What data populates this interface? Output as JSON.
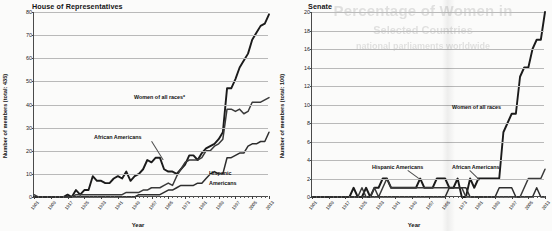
{
  "page": {
    "bleed_text_line1": "Percentage of Women in",
    "bleed_text_line2": "Selected Countries",
    "bleed_text_line3": "national parliaments worldwide"
  },
  "charts": [
    {
      "id": "house",
      "title": "House of Representatives",
      "xlabel": "Year",
      "ylabel": "Number of members (total: 435)",
      "yticks": [
        0,
        10,
        20,
        30,
        40,
        50,
        60,
        70,
        80
      ],
      "ylim": [
        0,
        80
      ],
      "xticks": [
        1901,
        1909,
        1917,
        1925,
        1933,
        1941,
        1949,
        1957,
        1965,
        1973,
        1981,
        1989,
        1997,
        2005,
        2013
      ],
      "xlim": [
        1901,
        2013
      ],
      "annotations": [
        {
          "name": "women-of-all-races",
          "text": "Women of all races*"
        },
        {
          "name": "african-americans",
          "text": "African Americans"
        },
        {
          "name": "hispanic-americans-line1",
          "text": "Hispanic"
        },
        {
          "name": "hispanic-americans-line2",
          "text": "Americans"
        }
      ]
    },
    {
      "id": "senate",
      "title": "Senate",
      "xlabel": "Year",
      "ylabel": "Number of members (total: 100)",
      "yticks": [
        0,
        2,
        4,
        6,
        8,
        10,
        12,
        14,
        16,
        18,
        20
      ],
      "ylim": [
        0,
        20
      ],
      "xticks": [
        1901,
        1909,
        1917,
        1925,
        1933,
        1941,
        1949,
        1957,
        1965,
        1973,
        1981,
        1989,
        1997,
        2005,
        2013
      ],
      "xlim": [
        1901,
        2013
      ],
      "annotations": [
        {
          "name": "women-of-all-races",
          "text": "Women of all races"
        },
        {
          "name": "hispanic-americans",
          "text": "Hispanic Americans"
        },
        {
          "name": "african-americans",
          "text": "African Americans"
        }
      ]
    }
  ],
  "chart_data": [
    {
      "type": "line",
      "id": "house",
      "title": "House of Representatives",
      "xlabel": "Year",
      "ylabel": "Number of members (total: 435)",
      "xlim": [
        1901,
        2013
      ],
      "ylim": [
        0,
        80
      ],
      "grid": true,
      "legend": "inline-annotations",
      "x": [
        1901,
        1903,
        1905,
        1907,
        1909,
        1911,
        1913,
        1915,
        1917,
        1919,
        1921,
        1923,
        1925,
        1927,
        1929,
        1931,
        1933,
        1935,
        1937,
        1939,
        1941,
        1943,
        1945,
        1947,
        1949,
        1951,
        1953,
        1955,
        1957,
        1959,
        1961,
        1963,
        1965,
        1967,
        1969,
        1971,
        1973,
        1975,
        1977,
        1979,
        1981,
        1983,
        1985,
        1987,
        1989,
        1991,
        1993,
        1995,
        1997,
        1999,
        2001,
        2003,
        2005,
        2007,
        2009,
        2011,
        2013
      ],
      "series": [
        {
          "name": "Women of all races*",
          "values": [
            0,
            0,
            0,
            0,
            0,
            0,
            0,
            0,
            1,
            0,
            3,
            1,
            3,
            3,
            9,
            7,
            7,
            6,
            6,
            8,
            9,
            8,
            11,
            7,
            9,
            10,
            12,
            16,
            15,
            17,
            17,
            12,
            11,
            11,
            10,
            12,
            14,
            18,
            18,
            16,
            19,
            21,
            22,
            23,
            25,
            28,
            47,
            47,
            51,
            56,
            59,
            62,
            68,
            71,
            74,
            75,
            79
          ]
        },
        {
          "name": "African Americans",
          "values": [
            1,
            0,
            0,
            0,
            0,
            0,
            0,
            0,
            0,
            0,
            1,
            1,
            1,
            1,
            1,
            1,
            1,
            1,
            1,
            1,
            1,
            1,
            2,
            2,
            2,
            2,
            3,
            3,
            4,
            4,
            4,
            5,
            6,
            5,
            9,
            12,
            15,
            16,
            16,
            16,
            17,
            20,
            20,
            22,
            23,
            25,
            38,
            38,
            37,
            38,
            36,
            37,
            41,
            41,
            41,
            42,
            43
          ]
        },
        {
          "name": "Hispanic Americans",
          "values": [
            0,
            0,
            0,
            0,
            0,
            0,
            0,
            0,
            0,
            0,
            0,
            0,
            0,
            0,
            0,
            0,
            0,
            0,
            0,
            0,
            0,
            0,
            0,
            0,
            0,
            1,
            1,
            1,
            1,
            1,
            1,
            2,
            3,
            3,
            4,
            5,
            5,
            5,
            5,
            6,
            6,
            8,
            10,
            11,
            10,
            10,
            17,
            17,
            18,
            19,
            19,
            22,
            23,
            23,
            24,
            24,
            28
          ]
        }
      ]
    },
    {
      "type": "line",
      "id": "senate",
      "title": "Senate",
      "xlabel": "Year",
      "ylabel": "Number of members (total: 100)",
      "xlim": [
        1901,
        2013
      ],
      "ylim": [
        0,
        20
      ],
      "grid": true,
      "legend": "inline-annotations",
      "x": [
        1901,
        1903,
        1905,
        1907,
        1909,
        1911,
        1913,
        1915,
        1917,
        1919,
        1921,
        1923,
        1925,
        1927,
        1929,
        1931,
        1933,
        1935,
        1937,
        1939,
        1941,
        1943,
        1945,
        1947,
        1949,
        1951,
        1953,
        1955,
        1957,
        1959,
        1961,
        1963,
        1965,
        1967,
        1969,
        1971,
        1973,
        1975,
        1977,
        1979,
        1981,
        1983,
        1985,
        1987,
        1989,
        1991,
        1993,
        1995,
        1997,
        1999,
        2001,
        2003,
        2005,
        2007,
        2009,
        2011,
        2013
      ],
      "series": [
        {
          "name": "Women of all races",
          "values": [
            0,
            0,
            0,
            0,
            0,
            0,
            0,
            0,
            0,
            0,
            1,
            0,
            0,
            1,
            0,
            1,
            1,
            2,
            2,
            1,
            1,
            1,
            1,
            1,
            1,
            1,
            2,
            1,
            1,
            1,
            2,
            2,
            2,
            1,
            1,
            2,
            0,
            0,
            2,
            1,
            2,
            2,
            2,
            2,
            2,
            2,
            7,
            8,
            9,
            9,
            13,
            14,
            14,
            16,
            17,
            17,
            20
          ]
        },
        {
          "name": "Hispanic Americans",
          "values": [
            0,
            0,
            0,
            0,
            0,
            0,
            0,
            0,
            0,
            0,
            0,
            0,
            1,
            0,
            0,
            1,
            0,
            1,
            2,
            1,
            1,
            1,
            1,
            1,
            1,
            1,
            1,
            1,
            1,
            1,
            1,
            1,
            1,
            1,
            1,
            1,
            1,
            0,
            0,
            0,
            0,
            0,
            0,
            0,
            0,
            0,
            0,
            0,
            0,
            0,
            0,
            1,
            2,
            2,
            2,
            2,
            3
          ]
        },
        {
          "name": "African Americans",
          "values": [
            0,
            0,
            0,
            0,
            0,
            0,
            0,
            0,
            0,
            0,
            0,
            0,
            0,
            0,
            0,
            0,
            0,
            0,
            0,
            0,
            0,
            0,
            0,
            0,
            0,
            0,
            0,
            0,
            0,
            0,
            0,
            0,
            0,
            1,
            1,
            1,
            1,
            1,
            0,
            0,
            0,
            0,
            0,
            0,
            0,
            1,
            1,
            1,
            1,
            0,
            0,
            0,
            0,
            0,
            1,
            0,
            0
          ]
        }
      ]
    }
  ]
}
